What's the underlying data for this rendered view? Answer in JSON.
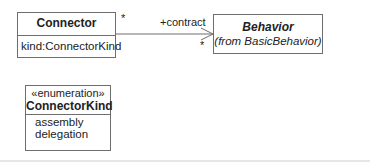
{
  "diagram": {
    "type": "UML class diagram",
    "classes": [
      {
        "id": "connector",
        "name": "Connector",
        "attributes": [
          "kind:ConnectorKind"
        ]
      },
      {
        "id": "behavior",
        "name": "Behavior",
        "subtitle": "(from BasicBehavior)",
        "abstract": true
      },
      {
        "id": "connectorkind",
        "stereotype": "«enumeration»",
        "name": "ConnectorKind",
        "literals": [
          "assembly",
          "delegation"
        ]
      }
    ],
    "associations": [
      {
        "from": "Connector",
        "to": "Behavior",
        "source_multiplicity": "*",
        "target_role": "+contract",
        "target_multiplicity": "*",
        "navigable_to_target": true
      }
    ]
  },
  "colors": {
    "line": "#6e6e6e",
    "text": "#222222",
    "background": "#ffffff"
  }
}
